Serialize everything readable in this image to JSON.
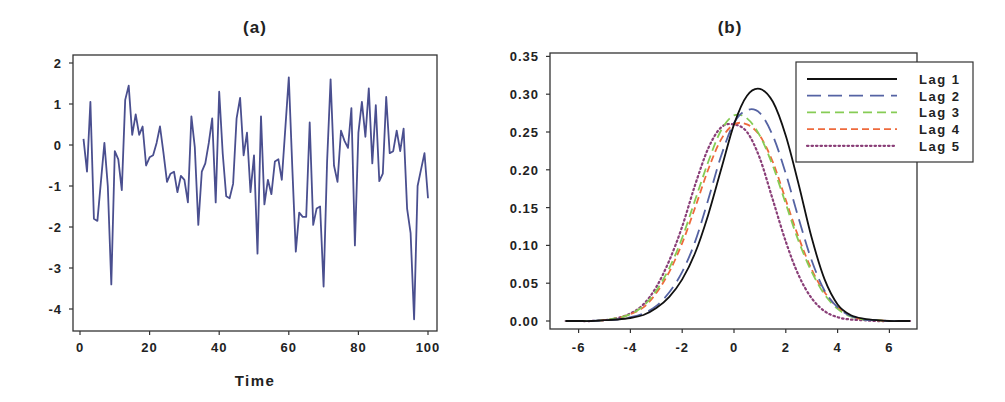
{
  "figure": {
    "panel_a": {
      "title": "(a)",
      "xlabel": "Time",
      "xticks": [
        "0",
        "20",
        "40",
        "60",
        "80",
        "100"
      ],
      "yticks": [
        "2",
        "1",
        "0",
        "-1",
        "-2",
        "-3",
        "-4"
      ]
    },
    "panel_b": {
      "title": "(b)",
      "xticks": [
        "-6",
        "-4",
        "-2",
        "0",
        "2",
        "4",
        "6"
      ],
      "yticks": [
        "0.35",
        "0.30",
        "0.25",
        "0.20",
        "0.15",
        "0.10",
        "0.05",
        "0.00"
      ],
      "legend": [
        "Lag 1",
        "Lag 2",
        "Lag 3",
        "Lag 4",
        "Lag 5"
      ]
    }
  },
  "chart_data": [
    {
      "type": "line",
      "title": "(a)",
      "xlabel": "Time",
      "ylabel": "",
      "xlim": [
        0,
        100
      ],
      "ylim": [
        -4.5,
        2.2
      ],
      "xticks": [
        0,
        20,
        40,
        60,
        80,
        100
      ],
      "yticks": [
        2,
        1,
        0,
        -1,
        -2,
        -3,
        -4
      ],
      "grid": false,
      "color": "#4a4f8f",
      "series": [
        {
          "name": "series",
          "x": [
            1,
            2,
            3,
            4,
            5,
            6,
            7,
            8,
            9,
            10,
            11,
            12,
            13,
            14,
            15,
            16,
            17,
            18,
            19,
            20,
            21,
            22,
            23,
            24,
            25,
            26,
            27,
            28,
            29,
            30,
            31,
            32,
            33,
            34,
            35,
            36,
            37,
            38,
            39,
            40,
            41,
            42,
            43,
            44,
            45,
            46,
            47,
            48,
            49,
            50,
            51,
            52,
            53,
            54,
            55,
            56,
            57,
            58,
            59,
            60,
            61,
            62,
            63,
            64,
            65,
            66,
            67,
            68,
            69,
            70,
            71,
            72,
            73,
            74,
            75,
            76,
            77,
            78,
            79,
            80,
            81,
            82,
            83,
            84,
            85,
            86,
            87,
            88,
            89,
            90,
            91,
            92,
            93,
            94,
            95,
            96,
            97,
            98,
            99,
            100
          ],
          "values": [
            0.15,
            -0.65,
            1.05,
            -1.8,
            -1.85,
            -0.9,
            0.05,
            -1.0,
            -3.4,
            -0.15,
            -0.35,
            -1.1,
            1.1,
            1.45,
            0.25,
            0.75,
            0.25,
            0.45,
            -0.5,
            -0.3,
            -0.25,
            0.05,
            0.45,
            -0.2,
            -0.9,
            -0.7,
            -0.65,
            -1.15,
            -0.75,
            -0.85,
            -1.4,
            0.7,
            -0.05,
            -1.95,
            -0.65,
            -0.45,
            0.05,
            0.65,
            -1.4,
            1.3,
            -0.2,
            -1.25,
            -1.3,
            -0.95,
            0.65,
            1.15,
            -0.25,
            0.3,
            -1.15,
            -0.25,
            -2.65,
            0.7,
            -1.45,
            -0.85,
            -1.2,
            -0.4,
            -0.35,
            -0.85,
            0.4,
            1.65,
            -0.55,
            -2.6,
            -1.65,
            -1.75,
            -1.75,
            0.55,
            -1.95,
            -1.55,
            -1.5,
            -3.45,
            -0.4,
            1.6,
            -0.5,
            -0.9,
            0.35,
            0.1,
            -0.07,
            0.9,
            -2.45,
            0.3,
            1.05,
            0.2,
            1.38,
            -0.45,
            0.97,
            -0.88,
            -0.7,
            1.17,
            -0.2,
            -0.15,
            0.35,
            -0.15,
            0.4,
            -1.55,
            -2.15,
            -4.25,
            -1.0,
            -0.6,
            -0.2,
            -1.3
          ]
        }
      ]
    },
    {
      "type": "line",
      "title": "(b)",
      "xlabel": "",
      "ylabel": "",
      "xlim": [
        -7,
        7.2
      ],
      "ylim": [
        -0.01,
        0.36
      ],
      "xticks": [
        -6,
        -4,
        -2,
        0,
        2,
        4,
        6
      ],
      "yticks": [
        0.0,
        0.05,
        0.1,
        0.15,
        0.2,
        0.25,
        0.3,
        0.35
      ],
      "grid": false,
      "legend_position": "upper right (extends outside frame)",
      "x": [
        -6.5,
        -6,
        -5.5,
        -5,
        -4.5,
        -4,
        -3.5,
        -3,
        -2.5,
        -2,
        -1.5,
        -1,
        -0.5,
        0,
        0.5,
        1,
        1.5,
        2,
        2.5,
        3,
        3.5,
        4,
        4.5,
        5,
        5.5,
        6,
        6.5,
        6.8
      ],
      "series": [
        {
          "name": "Lag 1",
          "color": "#111111",
          "dash": "solid",
          "values": [
            0,
            0,
            0,
            0.001,
            0.002,
            0.004,
            0.008,
            0.017,
            0.032,
            0.055,
            0.09,
            0.14,
            0.2,
            0.26,
            0.298,
            0.307,
            0.29,
            0.245,
            0.18,
            0.11,
            0.055,
            0.022,
            0.008,
            0.003,
            0.001,
            0,
            0,
            0
          ]
        },
        {
          "name": "Lag 2",
          "color": "#5563a3",
          "dash": "long-dash",
          "values": [
            0,
            0,
            0,
            0.001,
            0.002,
            0.005,
            0.01,
            0.02,
            0.038,
            0.065,
            0.105,
            0.16,
            0.218,
            0.262,
            0.279,
            0.275,
            0.245,
            0.195,
            0.135,
            0.08,
            0.04,
            0.018,
            0.007,
            0.002,
            0.001,
            0,
            0,
            0
          ]
        },
        {
          "name": "Lag 3",
          "color": "#86cc55",
          "dash": "dash",
          "values": [
            0,
            0,
            0,
            0.001,
            0.004,
            0.009,
            0.02,
            0.04,
            0.07,
            0.11,
            0.16,
            0.21,
            0.252,
            0.272,
            0.268,
            0.245,
            0.205,
            0.155,
            0.105,
            0.065,
            0.035,
            0.016,
            0.006,
            0.002,
            0.001,
            0,
            0,
            0
          ]
        },
        {
          "name": "Lag 4",
          "color": "#ee6a3c",
          "dash": "short-dash",
          "values": [
            0,
            0,
            0,
            0.001,
            0.004,
            0.009,
            0.018,
            0.037,
            0.065,
            0.103,
            0.15,
            0.2,
            0.24,
            0.26,
            0.26,
            0.245,
            0.21,
            0.16,
            0.11,
            0.068,
            0.038,
            0.018,
            0.007,
            0.002,
            0.001,
            0,
            0,
            0
          ]
        },
        {
          "name": "Lag 5",
          "color": "#8a3f78",
          "dash": "dotted",
          "values": [
            0,
            0,
            0,
            0.001,
            0.004,
            0.01,
            0.022,
            0.045,
            0.08,
            0.125,
            0.18,
            0.228,
            0.256,
            0.26,
            0.25,
            0.215,
            0.16,
            0.105,
            0.06,
            0.03,
            0.013,
            0.005,
            0.002,
            0.001,
            0,
            0,
            0,
            0
          ]
        }
      ]
    }
  ]
}
